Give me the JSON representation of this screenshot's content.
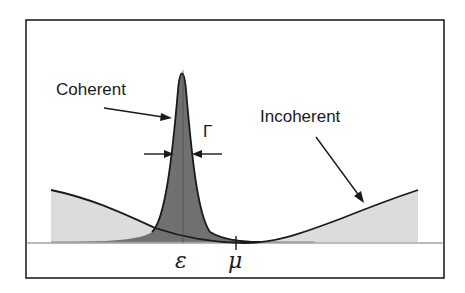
{
  "diagram": {
    "labels": {
      "coherent": "Coherent",
      "incoherent": "Incoherent",
      "width": "Γ",
      "epsilon": "ε",
      "mu": "μ"
    },
    "colors": {
      "frame": "#222222",
      "curve": "#1a1a1a",
      "coherent_fill": "#6e6e6e",
      "incoherent_fill": "#dcdcdc",
      "overlap_fill": "#a8a8a8",
      "baseline": "#777777"
    },
    "elements": [
      "coherent-peak (narrow Lorentzian centered at ε)",
      "incoherent-background (broad curve with minimum near μ)",
      "width-arrows indicating Γ",
      "baseline axis"
    ]
  }
}
